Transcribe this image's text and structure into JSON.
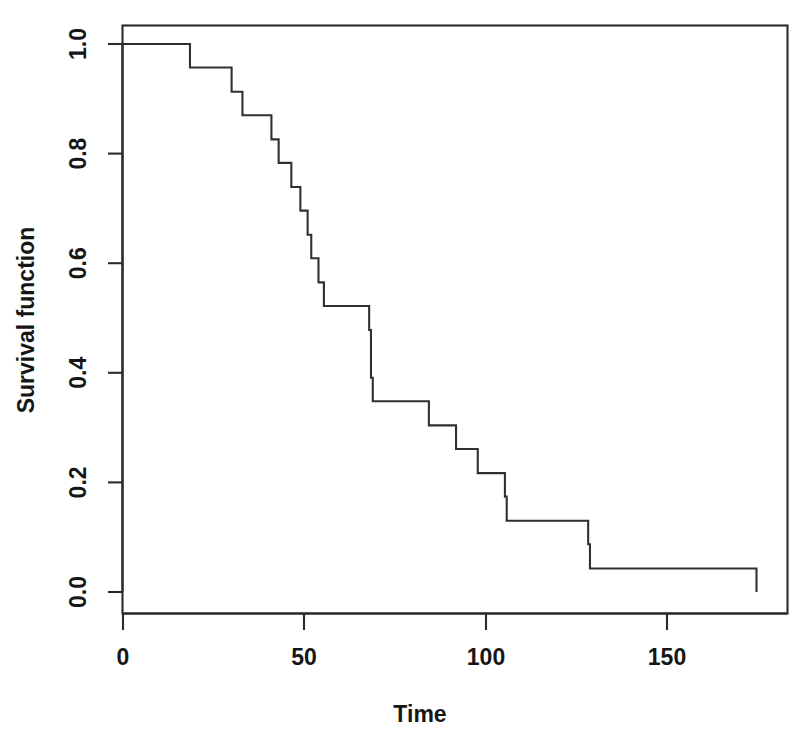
{
  "figure": {
    "background_color": "#ffffff",
    "line_color": "#303030",
    "axis_color": "#2b2b2b",
    "text_color": "#161616"
  },
  "axes": {
    "x_title": "Time",
    "y_title": "Survival function",
    "x_ticks": [
      "0",
      "50",
      "100",
      "150"
    ],
    "y_ticks": [
      "0.0",
      "0.2",
      "0.4",
      "0.6",
      "0.8",
      "1.0"
    ]
  },
  "chart_data": {
    "type": "line",
    "title": "",
    "subtitle": "",
    "xlabel": "Time",
    "ylabel": "Survival function",
    "xlim": [
      -4,
      183
    ],
    "ylim": [
      -0.04,
      1.04
    ],
    "xticks": [
      0,
      50,
      100,
      150
    ],
    "yticks": [
      0.0,
      0.2,
      0.4,
      0.6,
      0.8,
      1.0
    ],
    "grid": false,
    "legend": "none",
    "style": "step-post",
    "series": [
      {
        "name": "Kaplan-Meier survival estimate",
        "x": [
          0,
          18.5,
          30,
          33,
          41,
          43,
          46.5,
          49,
          51,
          52,
          54,
          55.5,
          68,
          68.5,
          69,
          84.5,
          92,
          98,
          105.5,
          106,
          128.5,
          129,
          175
        ],
        "y": [
          1.0,
          0.957,
          0.913,
          0.87,
          0.826,
          0.783,
          0.739,
          0.696,
          0.652,
          0.609,
          0.565,
          0.522,
          0.478,
          0.391,
          0.348,
          0.304,
          0.261,
          0.217,
          0.174,
          0.13,
          0.087,
          0.043,
          0.0
        ]
      }
    ],
    "step_points": [
      {
        "t": 0,
        "s": 1.0
      },
      {
        "t": 18.5,
        "s": 0.957
      },
      {
        "t": 30,
        "s": 0.913
      },
      {
        "t": 33,
        "s": 0.87
      },
      {
        "t": 41,
        "s": 0.826
      },
      {
        "t": 43,
        "s": 0.783
      },
      {
        "t": 46.5,
        "s": 0.739
      },
      {
        "t": 49,
        "s": 0.696
      },
      {
        "t": 51,
        "s": 0.652
      },
      {
        "t": 52,
        "s": 0.609
      },
      {
        "t": 54,
        "s": 0.565
      },
      {
        "t": 55.5,
        "s": 0.522
      },
      {
        "t": 68,
        "s": 0.478
      },
      {
        "t": 68.5,
        "s": 0.391
      },
      {
        "t": 69,
        "s": 0.348
      },
      {
        "t": 84.5,
        "s": 0.304
      },
      {
        "t": 92,
        "s": 0.261
      },
      {
        "t": 98,
        "s": 0.217
      },
      {
        "t": 105.5,
        "s": 0.174
      },
      {
        "t": 106,
        "s": 0.13
      },
      {
        "t": 128.5,
        "s": 0.087
      },
      {
        "t": 129,
        "s": 0.043
      },
      {
        "t": 175,
        "s": 0.0
      }
    ]
  }
}
